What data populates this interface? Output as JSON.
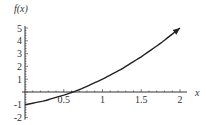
{
  "chart_data": {
    "type": "line",
    "title": "",
    "xlabel": "x",
    "ylabel": "f(x)",
    "xlim": [
      0,
      2
    ],
    "ylim": [
      -2,
      5
    ],
    "x_ticks": [
      "0.5",
      "1",
      "1.5",
      "2"
    ],
    "y_ticks": [
      "5",
      "4",
      "3",
      "2",
      "1",
      "-1",
      "-2"
    ],
    "series": [
      {
        "name": "f(x)",
        "x": [
          0,
          0.25,
          0.5,
          0.618,
          0.75,
          1,
          1.25,
          1.5,
          1.75,
          2
        ],
        "values": [
          -1,
          -0.69,
          -0.25,
          0,
          0.31,
          1,
          1.81,
          2.75,
          3.81,
          5
        ],
        "end_arrow": true
      }
    ],
    "grid": false,
    "legend": null
  },
  "colors": {
    "axis": "#333333",
    "curve": "#222222"
  }
}
